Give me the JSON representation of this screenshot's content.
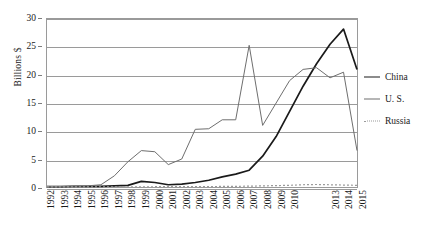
{
  "chart_data": {
    "type": "line",
    "title": "",
    "xlabel": "",
    "ylabel": "Billions $",
    "ylim": [
      0,
      30
    ],
    "yticks": [
      0,
      5,
      10,
      15,
      20,
      25,
      30
    ],
    "grid": true,
    "legend_position": "right",
    "x": [
      1992,
      1993,
      1994,
      1995,
      1996,
      1997,
      1998,
      1999,
      2000,
      2001,
      2002,
      2003,
      2004,
      2005,
      2006,
      2007,
      2008,
      2009,
      2010,
      2011,
      2012,
      2013,
      2014,
      2015
    ],
    "tick_labels": [
      "1992",
      "1993",
      "1994",
      "1995",
      "1996",
      "1997",
      "1998",
      "1999",
      "2000",
      "2001",
      "2002",
      "2003",
      "2004",
      "2005",
      "2006",
      "2007",
      "2008",
      "2009",
      "2010",
      "",
      "",
      "2013",
      "2014",
      "2015"
    ],
    "series": [
      {
        "name": "China",
        "color": "#1a1a1a",
        "style": "solid-thick",
        "values": [
          0.05,
          0.05,
          0.1,
          0.1,
          0.1,
          0.2,
          0.3,
          1.0,
          0.8,
          0.4,
          0.5,
          0.8,
          1.2,
          1.8,
          2.3,
          3.0,
          5.5,
          9.0,
          13.5,
          18.0,
          22.0,
          25.5,
          28.2,
          21.0
        ]
      },
      {
        "name": "U. S.",
        "color": "#6e6e6e",
        "style": "solid-thin",
        "values": [
          0.1,
          0.1,
          0.15,
          0.2,
          0.4,
          2.0,
          4.5,
          6.5,
          6.3,
          4.0,
          5.0,
          10.3,
          10.4,
          12.0,
          12.0,
          25.3,
          11.0,
          15.0,
          19.0,
          21.0,
          21.3,
          19.5,
          20.5,
          6.5
        ]
      },
      {
        "name": "Russia",
        "color": "#9a9a9a",
        "style": "dotted",
        "values": [
          0.02,
          0.02,
          0.02,
          0.02,
          0.02,
          0.03,
          0.03,
          0.04,
          0.05,
          0.05,
          0.05,
          0.06,
          0.08,
          0.1,
          0.12,
          0.15,
          0.2,
          0.25,
          0.3,
          0.4,
          0.45,
          0.4,
          0.35,
          0.3
        ]
      }
    ]
  },
  "legend": {
    "items": [
      {
        "label": "China"
      },
      {
        "label": "U. S."
      },
      {
        "label": "Russia"
      }
    ]
  }
}
